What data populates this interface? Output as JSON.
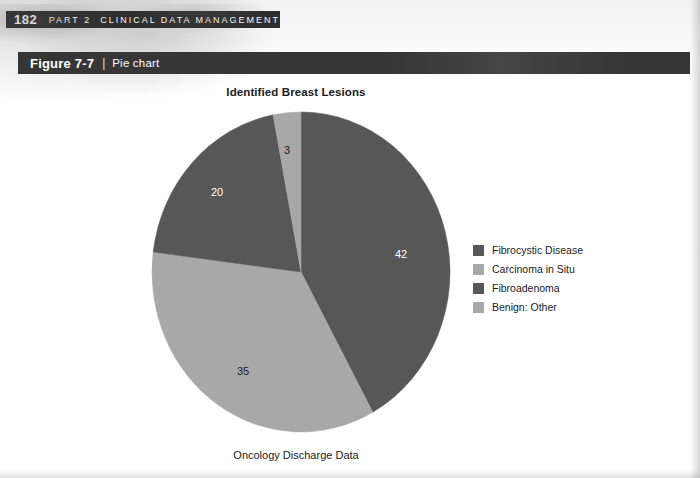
{
  "page": {
    "folio": "182",
    "running_head_part": "PART 2",
    "running_head_title": "CLINICAL DATA MANAGEMENT"
  },
  "figure_bar": {
    "number": "Figure 7-7",
    "separator": "|",
    "title": "Pie chart"
  },
  "colors": {
    "dark_slice": "#575757",
    "light_slice": "#a8a8a8",
    "bar_dark": "#363636",
    "head_dark": "#2e2e2e",
    "label_light": "#ffffff",
    "label_dark": "#1b1b1b"
  },
  "chart_data": {
    "type": "pie",
    "title": "Identified Breast Lesions",
    "caption": "Oncology Discharge Data",
    "legend_position": "right",
    "start_angle_deg": 0,
    "direction": "clockwise",
    "total": 100,
    "categories": [
      "Fibrocystic Disease",
      "Carcinoma in Situ",
      "Fibroadenoma",
      "Benign: Other"
    ],
    "values": [
      42,
      35,
      20,
      3
    ],
    "slices": [
      {
        "label": "Fibrocystic Disease",
        "value": 42,
        "data_label": "42",
        "color": "#575757",
        "label_color": "#ffffff",
        "label_x": 401,
        "label_y": 258
      },
      {
        "label": "Carcinoma in Situ",
        "value": 35,
        "data_label": "35",
        "color": "#a8a8a8",
        "label_color": "#1b1b1b",
        "label_x": 243,
        "label_y": 375
      },
      {
        "label": "Fibroadenoma",
        "value": 20,
        "data_label": "20",
        "color": "#575757",
        "label_color": "#ffffff",
        "label_x": 217,
        "label_y": 196
      },
      {
        "label": "Benign: Other",
        "value": 3,
        "data_label": "3",
        "color": "#a8a8a8",
        "label_color": "#1b1b1b",
        "label_x": 287,
        "label_y": 154
      }
    ],
    "legend": [
      {
        "label": "Fibrocystic Disease",
        "color": "#575757"
      },
      {
        "label": "Carcinoma in Situ",
        "color": "#a8a8a8"
      },
      {
        "label": "Fibroadenoma",
        "color": "#575757"
      },
      {
        "label": "Benign: Other",
        "color": "#a8a8a8"
      }
    ]
  }
}
